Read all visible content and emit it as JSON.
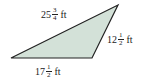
{
  "figure": {
    "shape": "triangle",
    "fill_color": "#d3e1d8",
    "stroke_color": "#222222",
    "vertices": [
      [
        11,
        58
      ],
      [
        92,
        58
      ],
      [
        118,
        5
      ]
    ],
    "sides": {
      "top": {
        "whole": "25",
        "num": "3",
        "den": "4",
        "unit": "ft"
      },
      "right": {
        "whole": "12",
        "num": "1",
        "den": "2",
        "unit": "ft"
      },
      "bottom": {
        "whole": "17",
        "num": "1",
        "den": "2",
        "unit": "ft"
      }
    }
  }
}
